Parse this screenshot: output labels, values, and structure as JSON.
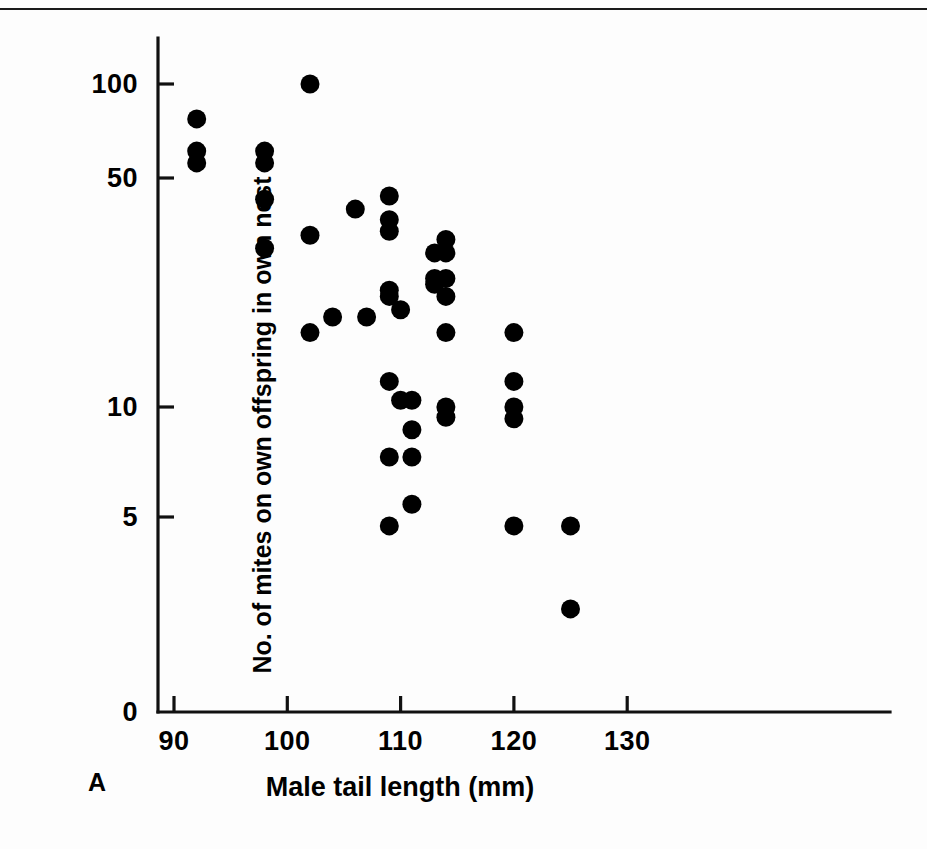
{
  "figure": {
    "panel_label": "A",
    "background_color": "#fdfdfd",
    "marker_color": "#000000",
    "axis_color": "#111111"
  },
  "chart_data": {
    "type": "scatter",
    "title": "",
    "subtitle": "",
    "xlabel": "Male tail length (mm)",
    "ylabel": "No. of mites on own offspring in own nest",
    "xlim": [
      88,
      132
    ],
    "ylim": [
      0,
      115
    ],
    "yscale": "log-like-broken",
    "grid": false,
    "legend": null,
    "annotations": [
      "A"
    ],
    "xticks": [
      90,
      100,
      110,
      120,
      130
    ],
    "xtick_labels": [
      "90",
      "100",
      "110",
      "120",
      "130"
    ],
    "yticks": [
      0,
      5,
      10,
      50,
      100
    ],
    "ytick_labels": [
      "0",
      "5",
      "10",
      "50",
      "100"
    ],
    "n_points": 44,
    "points": [
      {
        "x": 92,
        "y": 78
      },
      {
        "x": 92,
        "y": 62
      },
      {
        "x": 92,
        "y": 57
      },
      {
        "x": 98,
        "y": 62
      },
      {
        "x": 98,
        "y": 57
      },
      {
        "x": 98,
        "y": 44
      },
      {
        "x": 98,
        "y": 31
      },
      {
        "x": 102,
        "y": 100
      },
      {
        "x": 102,
        "y": 34
      },
      {
        "x": 102,
        "y": 17
      },
      {
        "x": 104,
        "y": 19
      },
      {
        "x": 106,
        "y": 41
      },
      {
        "x": 107,
        "y": 19
      },
      {
        "x": 109,
        "y": 45
      },
      {
        "x": 109,
        "y": 38
      },
      {
        "x": 109,
        "y": 35
      },
      {
        "x": 109,
        "y": 23
      },
      {
        "x": 109,
        "y": 22
      },
      {
        "x": 109,
        "y": 12
      },
      {
        "x": 109,
        "y": 7
      },
      {
        "x": 109,
        "y": 4
      },
      {
        "x": 110,
        "y": 20
      },
      {
        "x": 110,
        "y": 10.5
      },
      {
        "x": 111,
        "y": 10.5
      },
      {
        "x": 111,
        "y": 8.5
      },
      {
        "x": 111,
        "y": 7
      },
      {
        "x": 111,
        "y": 5
      },
      {
        "x": 113,
        "y": 30
      },
      {
        "x": 113,
        "y": 25
      },
      {
        "x": 113,
        "y": 24
      },
      {
        "x": 114,
        "y": 33
      },
      {
        "x": 114,
        "y": 30
      },
      {
        "x": 114,
        "y": 25
      },
      {
        "x": 114,
        "y": 22
      },
      {
        "x": 114,
        "y": 17
      },
      {
        "x": 114,
        "y": 10
      },
      {
        "x": 114,
        "y": 9.3
      },
      {
        "x": 120,
        "y": 17
      },
      {
        "x": 120,
        "y": 12
      },
      {
        "x": 120,
        "y": 10
      },
      {
        "x": 120,
        "y": 9.2
      },
      {
        "x": 120,
        "y": 4
      },
      {
        "x": 125,
        "y": 4
      },
      {
        "x": 125,
        "y": 1.7
      }
    ]
  }
}
